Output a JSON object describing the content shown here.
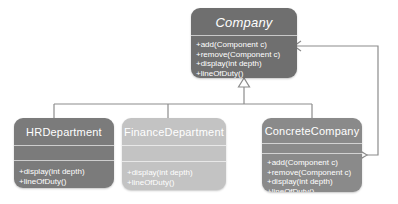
{
  "diagram": {
    "kind": "uml-class-diagram",
    "background_color": "#ffffff",
    "line_color": "#8c8c8c"
  },
  "classes": {
    "company": {
      "name": "Company",
      "abstract": true,
      "fill_color": "#6f6f6f",
      "attributes": [],
      "methods": [
        "+add(Component c)",
        "+remove(Component c)",
        "+display(int depth)",
        "+lineOfDuty()"
      ]
    },
    "hr_department": {
      "name": "HRDepartment",
      "abstract": false,
      "fill_color": "#7b7b7b",
      "attributes": [],
      "methods": [
        "+display(int depth)",
        "+lineOfDuty()"
      ]
    },
    "finance_department": {
      "name": "FinanceDepartment",
      "abstract": false,
      "fill_color": "#c3c3c3",
      "attributes": [],
      "methods": [
        "+display(int depth)",
        "+lineOfDuty()"
      ]
    },
    "concrete_company": {
      "name": "ConcreteCompany",
      "abstract": false,
      "fill_color": "#8a8a8a",
      "attributes": [],
      "methods": [
        "+add(Component c)",
        "+remove(Component c)",
        "+display(int depth)",
        "+lineOfDuty()"
      ]
    }
  },
  "relationships": [
    {
      "id": "inheritance-hr",
      "type": "generalization",
      "from": "hr_department",
      "to": "company",
      "marker": "hollow-triangle"
    },
    {
      "id": "inheritance-finance",
      "type": "generalization",
      "from": "finance_department",
      "to": "company",
      "marker": "hollow-triangle"
    },
    {
      "id": "inheritance-concrete",
      "type": "generalization",
      "from": "concrete_company",
      "to": "company",
      "marker": "hollow-triangle"
    },
    {
      "id": "aggregation-concrete-company",
      "type": "aggregation",
      "from": "concrete_company",
      "to": "company",
      "marker": "hollow-diamond",
      "arrow": "open-arrow"
    }
  ]
}
